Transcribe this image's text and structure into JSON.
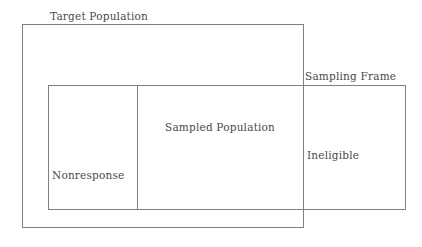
{
  "diagram": {
    "type": "venn-nested-rectangles",
    "background_color": "#ffffff",
    "stroke_color": "#808080",
    "text_color": "#4a4a4a",
    "stroke_width": 1,
    "regions": [
      {
        "id": "target-population",
        "label": "Target Population",
        "label_position": "above-left-outside",
        "x": 22,
        "y": 24,
        "width": 281,
        "height": 203
      },
      {
        "id": "sampling-frame",
        "label": "Sampling Frame",
        "label_position": "above-right-outside",
        "x": 48,
        "y": 85,
        "width": 357,
        "height": 124
      },
      {
        "id": "nonresponse",
        "label": "Nonresponse",
        "label_position": "inside-center",
        "x": 48,
        "y": 85,
        "width": 89,
        "height": 124
      },
      {
        "id": "sampled-population",
        "label": "Sampled Population",
        "label_position": "inside-center",
        "x": 137,
        "y": 85,
        "width": 166,
        "height": 124
      },
      {
        "id": "ineligible",
        "label": "Ineligible",
        "label_position": "inside-left",
        "x": 303,
        "y": 85,
        "width": 102,
        "height": 124
      }
    ]
  }
}
